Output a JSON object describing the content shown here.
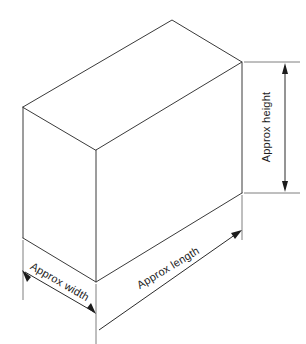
{
  "diagram": {
    "background_color": "#ffffff",
    "line_color": "#3a3a3a",
    "label_color": "#1c1c1c",
    "shape": "rectangular-box-isometric",
    "labels": {
      "height": "Approx height",
      "length": "Approx length",
      "width": "Approx width"
    },
    "dimensions": [
      {
        "name": "height",
        "label": "Approx height",
        "orientation": "vertical",
        "rotation_deg": -90,
        "side": "right"
      },
      {
        "name": "length",
        "label": "Approx length",
        "orientation": "diagonal-up-right",
        "rotation_deg": -31,
        "side": "bottom-right"
      },
      {
        "name": "width",
        "label": "Approx width",
        "orientation": "diagonal-down-right",
        "rotation_deg": 30,
        "side": "bottom-left"
      }
    ],
    "vertices": {
      "top_left": "23,107",
      "top_back": "172,20",
      "top_right": "242,62",
      "top_front": "96,150",
      "bottom_left": "23,238",
      "bottom_front": "96,282",
      "bottom_right": "242,193"
    }
  }
}
